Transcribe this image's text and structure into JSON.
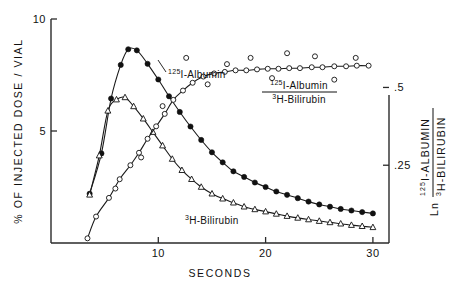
{
  "chart_data": {
    "type": "line",
    "title": "",
    "xlabel": "SECONDS",
    "ylabel_left": "% OF INJECTED DOSE / VIAL",
    "ylabel_right": "Ln (125I-ALBUMIN / 3H-BILIRUBIN)",
    "xlim": [
      0,
      31.5
    ],
    "ylim_left": [
      0,
      10
    ],
    "ylim_right": [
      0,
      0.72
    ],
    "grid": false,
    "legend_position": "inline-annotations",
    "x_ticks": [
      "10",
      "20",
      "30"
    ],
    "x_tick_values": [
      10,
      20,
      30
    ],
    "y_ticks_left": [
      "10",
      "5"
    ],
    "y_tick_values_left": [
      10,
      5
    ],
    "y_ticks_right": [
      ".5",
      ".25"
    ],
    "y_tick_values_right": [
      0.5,
      0.25
    ],
    "series": [
      {
        "name": "125I-Albumin",
        "label_parts": {
          "sup": "125",
          "main": "I-Albumin"
        },
        "marker": "filled-circle",
        "axis": "left",
        "x": [
          3.6,
          4.7,
          5.6,
          6.5,
          7.2,
          8.0,
          9.0,
          10.0,
          11.0,
          12.0,
          13.0,
          14.0,
          15.0,
          16.0,
          17.0,
          18.0,
          19.0,
          20.0,
          21.0,
          22.0,
          23.0,
          24.0,
          25.0,
          26.0,
          27.0,
          28.0,
          29.0,
          30.0
        ],
        "values": [
          2.2,
          4.0,
          6.45,
          7.95,
          8.65,
          8.6,
          8.0,
          7.3,
          6.55,
          5.85,
          5.2,
          4.6,
          4.05,
          3.6,
          3.2,
          2.95,
          2.7,
          2.5,
          2.3,
          2.15,
          2.0,
          1.85,
          1.72,
          1.62,
          1.52,
          1.45,
          1.38,
          1.32
        ]
      },
      {
        "name": "3H-Bilirubin",
        "label_parts": {
          "sup": "3",
          "main": "H-Bilirubin"
        },
        "marker": "open-triangle",
        "axis": "left",
        "x": [
          3.6,
          4.5,
          5.3,
          6.1,
          6.9,
          7.7,
          8.6,
          9.5,
          10.4,
          11.3,
          12.2,
          13.1,
          14.0,
          15.0,
          16.0,
          17.0,
          18.0,
          19.0,
          20.0,
          21.0,
          22.0,
          23.0,
          24.0,
          25.0,
          26.0,
          27.0,
          28.0,
          29.0,
          30.0
        ],
        "values": [
          2.15,
          3.9,
          5.9,
          6.4,
          6.5,
          6.1,
          5.55,
          4.95,
          4.35,
          3.75,
          3.25,
          2.85,
          2.5,
          2.2,
          1.98,
          1.8,
          1.62,
          1.5,
          1.4,
          1.3,
          1.2,
          1.12,
          1.05,
          0.98,
          0.92,
          0.86,
          0.8,
          0.75,
          0.7
        ]
      },
      {
        "name": "125I-Albumin / 3H-Bilirubin",
        "label_parts": {
          "num_sup": "125",
          "num_main": "I-Albumin",
          "den_sup": "3",
          "den_main": "H-Bilirubin"
        },
        "marker": "open-circle",
        "axis": "right",
        "x": [
          3.4,
          4.2,
          5.4,
          6.4,
          7.4,
          8.2,
          9.0,
          9.8,
          10.6,
          11.4,
          12.3,
          13.2,
          14.2,
          15.2,
          16.2,
          17.2,
          18.2,
          19.2,
          20.2,
          21.2,
          22.2,
          23.2,
          24.3,
          25.3,
          26.4,
          27.5,
          28.5,
          29.6
        ],
        "values": [
          0.015,
          0.085,
          0.145,
          0.205,
          0.25,
          0.29,
          0.335,
          0.375,
          0.415,
          0.46,
          0.49,
          0.515,
          0.535,
          0.545,
          0.55,
          0.555,
          0.555,
          0.558,
          0.56,
          0.56,
          0.562,
          0.562,
          0.565,
          0.565,
          0.568,
          0.568,
          0.57,
          0.57
        ],
        "scatter_x": [
          6.0,
          8.4,
          10.4,
          12.6,
          14.6,
          16.4,
          18.6,
          20.6,
          22.0,
          24.6,
          26.4,
          28.4
        ],
        "scatter_values": [
          0.175,
          0.275,
          0.44,
          0.595,
          0.51,
          0.575,
          0.595,
          0.53,
          0.61,
          0.6,
          0.525,
          0.595
        ]
      }
    ],
    "annotations": [
      {
        "text": "125I-Albumin",
        "x_px": 168,
        "y_px": 74
      },
      {
        "text": "3H-Bilirubin",
        "x_px": 186,
        "y_px": 220
      },
      {
        "text": "125I-Albumin / 3H-Bilirubin",
        "x_px": 300,
        "y_px": 88
      }
    ]
  },
  "axes": {
    "x_title": "SECONDS",
    "y_left_title": "% OF INJECTED DOSE / VIAL",
    "y_right": {
      "ln": "Ln",
      "numerator_sup": "125",
      "numerator_main": "I-ALBUMIN",
      "denominator_sup": "3",
      "denominator_main": "H-BILIRUBIN"
    },
    "x_tick_labels": [
      "10",
      "20",
      "30"
    ],
    "y_left_tick_labels": [
      "10",
      "5"
    ],
    "y_right_tick_labels": [
      ".5",
      ".25"
    ]
  },
  "labels": {
    "albumin_sup": "125",
    "albumin_main": "I-Albumin",
    "bilirubin_sup": "3",
    "bilirubin_main": "H-Bilirubin",
    "ratio_num_sup": "125",
    "ratio_num_main": "I-Albumin",
    "ratio_den_sup": "3",
    "ratio_den_main": "H-Bilirubin"
  },
  "colors": {
    "ink": "#1a1a1a",
    "background": "#ffffff"
  }
}
